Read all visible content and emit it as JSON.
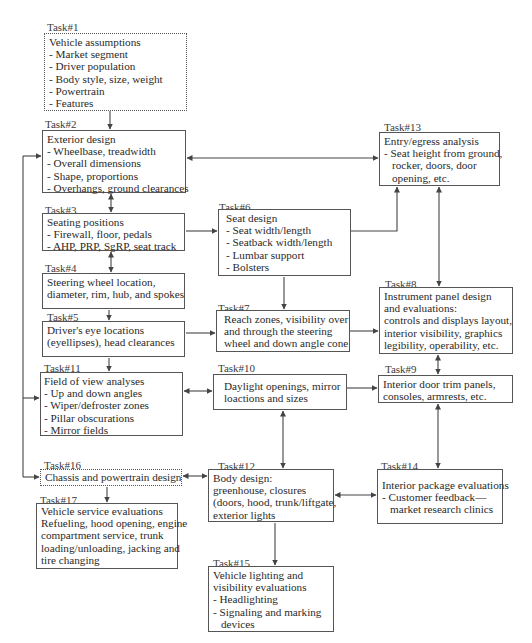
{
  "diagram": {
    "tasks": {
      "t1": {
        "label": "Task#1",
        "title": "Vehicle assumptions",
        "items": [
          "- Market segment",
          "- Driver population",
          "- Body style, size, weight",
          "- Powertrain",
          "- Features"
        ]
      },
      "t2": {
        "label": "Task#2",
        "title": "Exterior design",
        "items": [
          "- Wheelbase, treadwidth",
          "- Overall dimensions",
          "- Shape, proportions",
          "- Overhangs, ground clearances"
        ]
      },
      "t3": {
        "label": "Task#3",
        "title": "Seating positions",
        "items": [
          "- Firewall, floor, pedals",
          "- AHP, PRP, SgRP, seat track"
        ]
      },
      "t4": {
        "label": "Task#4",
        "lines": [
          "Steering wheel location,",
          "diameter, rim, hub, and spokes"
        ]
      },
      "t5": {
        "label": "Task#5",
        "lines": [
          "Driver's eye locations",
          "(eyellipses), head clearances"
        ]
      },
      "t6": {
        "label": "Task#6",
        "title": "Seat design",
        "items": [
          "- Seat width/length",
          "- Seatback width/length",
          "- Lumbar support",
          "- Bolsters"
        ]
      },
      "t7": {
        "label": "Task#7",
        "lines": [
          "Reach zones, visibility over",
          "and through the steering",
          "wheel and down angle cone"
        ]
      },
      "t8": {
        "label": "Task#8",
        "lines": [
          "Instrument panel design",
          "and evaluations:",
          "controls and displays layout,",
          "interior visibility, graphics",
          "legibility, operability, etc."
        ]
      },
      "t9": {
        "label": "Task#9",
        "lines": [
          "Interior door trim panels,",
          "consoles, armrests, etc."
        ]
      },
      "t10": {
        "label": "Task#10",
        "lines": [
          "Daylight openings, mirror",
          "loactions and sizes"
        ]
      },
      "t11": {
        "label": "Task#11",
        "title": "Field of view analyses",
        "items": [
          "- Up and down angles",
          "- Wiper/defroster zones",
          "- Pillar obscurations",
          "- Mirror fields"
        ]
      },
      "t12": {
        "label": "Task#12",
        "lines": [
          "Body design:",
          "greenhouse, closures",
          "(doors, hood, trunk/liftgate,",
          "exterior lights"
        ]
      },
      "t13": {
        "label": "Task#13",
        "title": "Entry/egress analysis",
        "lines": [
          "- Seat height from ground,",
          "rocker, doors, door",
          "opening, etc."
        ]
      },
      "t14": {
        "label": "Task#14",
        "title": "Interior package evaluations",
        "lines": [
          "- Customer feedback—",
          "market research clinics"
        ]
      },
      "t15": {
        "label": "Task#15",
        "lines": [
          "Vehicle lighting and",
          "visibility evaluations",
          "- Headlighting",
          "- Signaling and marking",
          "devices"
        ]
      },
      "t16": {
        "label": "Task#16",
        "lines": [
          "Chassis and powertrain design"
        ]
      },
      "t17": {
        "label": "Task#17",
        "lines": [
          "Vehicle service evaluations",
          "Refueling, hood opening, engine",
          "compartment service, trunk",
          "loading/unloading, jacking and",
          "tire changing"
        ]
      }
    },
    "colors": {
      "line": "#444444",
      "border": "#555555",
      "text": "#2a2a2a"
    }
  }
}
